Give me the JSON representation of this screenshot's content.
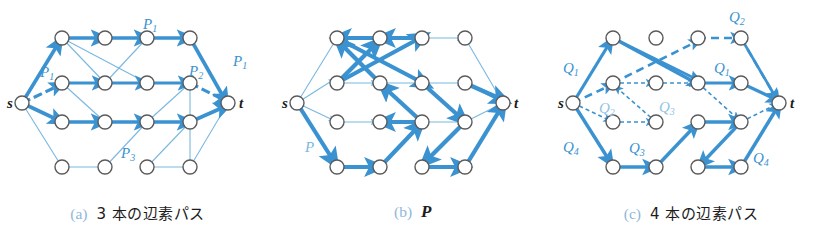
{
  "figure": {
    "accent_color": "#3a92d0",
    "accent_light": "#8fc4e6",
    "node_stroke": "#5a5a5a",
    "caption_tag_color": "#8fb8d8",
    "text_color": "#1a1a1a"
  },
  "panels": [
    {
      "id": "a",
      "caption_tag": "(a)",
      "caption_text": "3 本の辺素パス",
      "source_label": "s",
      "sink_label": "t",
      "path_labels": [
        {
          "text": "P",
          "sub": "1",
          "x": 47,
          "y": 72
        },
        {
          "text": "P",
          "sub": "1",
          "x": 150,
          "y": 24
        },
        {
          "text": "P",
          "sub": "1",
          "x": 240,
          "y": 62
        },
        {
          "text": "P",
          "sub": "2",
          "x": 196,
          "y": 73
        },
        {
          "text": "P",
          "sub": "3",
          "x": 128,
          "y": 155
        }
      ]
    },
    {
      "id": "b",
      "caption_tag": "(b)",
      "caption_text": "P",
      "caption_italic": true,
      "source_label": "s",
      "sink_label": "t",
      "path_labels": [
        {
          "text": "P",
          "sub": "",
          "x": 42,
          "y": 152
        }
      ]
    },
    {
      "id": "c",
      "caption_tag": "(c)",
      "caption_text": "4 本の辺素パス",
      "source_label": "s",
      "sink_label": "t",
      "path_labels": [
        {
          "text": "Q",
          "sub": "1",
          "x": 38,
          "y": 68
        },
        {
          "text": "Q",
          "sub": "2",
          "x": 195,
          "y": 22
        },
        {
          "text": "Q",
          "sub": "1",
          "x": 178,
          "y": 73
        },
        {
          "text": "Q",
          "sub": "2",
          "x": 75,
          "y": 110
        },
        {
          "text": "Q",
          "sub": "3",
          "x": 127,
          "y": 108
        },
        {
          "text": "Q",
          "sub": "3",
          "x": 95,
          "y": 150
        },
        {
          "text": "Q",
          "sub": "4",
          "x": 36,
          "y": 150
        },
        {
          "text": "Q",
          "sub": "4",
          "x": 228,
          "y": 160
        }
      ]
    }
  ],
  "graph": {
    "description": "Layered directed graph: source s, 4 rows x 4 columns of intermediate nodes, sink t",
    "rows": 4,
    "columns": 4,
    "node_radius": 7,
    "source": {
      "x": 22,
      "y": 103
    },
    "sink": {
      "x": 228,
      "y": 103
    },
    "grid_x": [
      62,
      105,
      147,
      190
    ],
    "grid_y": [
      38,
      83,
      122,
      167
    ]
  }
}
